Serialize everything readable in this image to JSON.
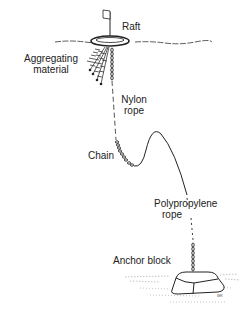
{
  "diagram": {
    "type": "labeled illustration",
    "labels": {
      "raft": "Raft",
      "aggregating_material": [
        "Aggregating",
        "material"
      ],
      "nylon_rope": [
        "Nylon",
        "rope"
      ],
      "chain": "Chain",
      "polypropylene_rope": [
        "Polypropylene",
        "rope"
      ],
      "anchor_block": "Anchor block"
    },
    "signature": "MK",
    "colors": {
      "ink": "#222222",
      "background": "#ffffff"
    }
  }
}
